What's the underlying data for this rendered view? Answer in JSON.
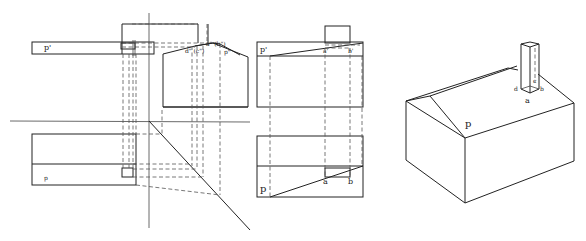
{
  "figure": {
    "views": [
      {
        "name": "orthographic-projection",
        "description": "Front, side and top views with projection lines and 45-degree miter line"
      },
      {
        "name": "two-view-construction",
        "description": "Front and top views showing roof slope line"
      },
      {
        "name": "isometric-view",
        "description": "3D house with gable roof and chimney"
      }
    ]
  },
  "labels": {
    "left": {
      "p_prime": "p'",
      "p": "p",
      "a_dd_b_dd": "a\" (b\")",
      "d_dd_c_dd": "d\" (c\")",
      "p_dd": "p\""
    },
    "middle": {
      "p_prime": "p'",
      "a_prime": "a'",
      "b_prime": "b'",
      "p": "p",
      "a": "a",
      "b": "b"
    },
    "right": {
      "p": "p",
      "a": "a",
      "b": "b",
      "c": "c",
      "d": "d"
    }
  }
}
